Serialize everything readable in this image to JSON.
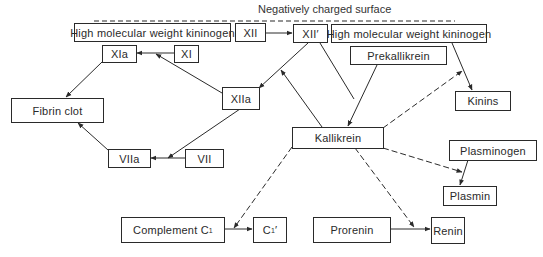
{
  "title": "Negatively charged surface",
  "nodes": {
    "hmwk_left": "High molecular weight kininogen",
    "xii": "XII",
    "xii_prime": "XII′",
    "hmwk_right": "High molecular weight kininogen",
    "xia": "XIa",
    "xi": "XI",
    "prekallikrein": "Prekallikrein",
    "fibrin_clot": "Fibrin clot",
    "xiia": "XIIa",
    "kinins": "Kinins",
    "kallikrein": "Kallikrein",
    "viia": "VIIa",
    "vii": "VII",
    "plasminogen": "Plasminogen",
    "plasmin": "Plasmin",
    "complement_c1": "Complement C",
    "complement_c1_sub": "1",
    "c1_prime": "C",
    "c1_prime_sub": "1",
    "c1_prime_mark": "′",
    "prorenin": "Prorenin",
    "renin": "Renin"
  },
  "edges": [
    {
      "from": "xii",
      "to": "xii_prime",
      "style": "solid"
    },
    {
      "from": "xi",
      "to": "xia",
      "style": "solid"
    },
    {
      "from": "xiia",
      "to": "xi-to-xia",
      "style": "solid"
    },
    {
      "from": "xia",
      "to": "fibrin_clot",
      "style": "solid"
    },
    {
      "from": "xii_prime",
      "to": "xiia",
      "style": "solid"
    },
    {
      "from": "kallikrein",
      "to": "xii_prime-to-xiia",
      "style": "solid"
    },
    {
      "from": "xii_prime",
      "to": "kallikrein",
      "style": "solid"
    },
    {
      "from": "prekallikrein",
      "to": "kallikrein",
      "style": "solid"
    },
    {
      "from": "hmwk_right",
      "to": "kinins",
      "style": "solid"
    },
    {
      "from": "kallikrein",
      "to": "hmwk-to-kinins",
      "style": "dashed"
    },
    {
      "from": "xiia",
      "to": "vii-to-viia",
      "style": "solid"
    },
    {
      "from": "vii",
      "to": "viia",
      "style": "solid"
    },
    {
      "from": "viia",
      "to": "fibrin_clot",
      "style": "solid"
    },
    {
      "from": "kallikrein",
      "to": "plasminogen-to-plasmin",
      "style": "dashed"
    },
    {
      "from": "plasminogen",
      "to": "plasmin",
      "style": "solid"
    },
    {
      "from": "kallikrein",
      "to": "complement-to-c1",
      "style": "dashed"
    },
    {
      "from": "complement_c1",
      "to": "c1_prime",
      "style": "solid"
    },
    {
      "from": "kallikrein",
      "to": "prorenin-to-renin",
      "style": "dashed"
    },
    {
      "from": "prorenin",
      "to": "renin",
      "style": "solid"
    }
  ]
}
